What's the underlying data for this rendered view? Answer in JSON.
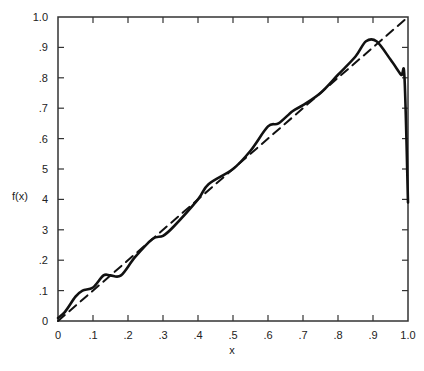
{
  "chart_data": {
    "type": "line",
    "title": "",
    "xlabel": "x",
    "ylabel": "f(x)",
    "xlim": [
      0,
      1.0
    ],
    "ylim": [
      0,
      1.0
    ],
    "grid": false,
    "legend": null,
    "x_ticks": [
      "0",
      ".1",
      ".2",
      ".3",
      ".4",
      ".5",
      ".6",
      ".7",
      ".8",
      ".9",
      "1.0"
    ],
    "y_ticks": [
      "0",
      ".1",
      ".2",
      "3",
      "4",
      "5",
      ".6",
      ".7",
      ".8",
      ".9",
      "1.0"
    ],
    "series": [
      {
        "name": "f(x)",
        "style": "solid",
        "color": "#111111",
        "x": [
          0.0,
          0.02,
          0.05,
          0.07,
          0.1,
          0.13,
          0.15,
          0.18,
          0.22,
          0.27,
          0.3,
          0.33,
          0.4,
          0.43,
          0.5,
          0.55,
          0.6,
          0.63,
          0.67,
          0.7,
          0.75,
          0.8,
          0.85,
          0.88,
          0.91,
          0.95,
          0.98,
          0.99,
          1.0
        ],
        "y": [
          0.01,
          0.03,
          0.08,
          0.1,
          0.11,
          0.15,
          0.15,
          0.15,
          0.21,
          0.27,
          0.28,
          0.31,
          0.4,
          0.45,
          0.5,
          0.56,
          0.64,
          0.65,
          0.69,
          0.71,
          0.75,
          0.81,
          0.87,
          0.92,
          0.92,
          0.86,
          0.81,
          0.8,
          0.39
        ]
      },
      {
        "name": "y = x",
        "style": "dashed",
        "color": "#111111",
        "x": [
          0.0,
          1.0
        ],
        "y": [
          0.0,
          1.0
        ]
      }
    ]
  }
}
